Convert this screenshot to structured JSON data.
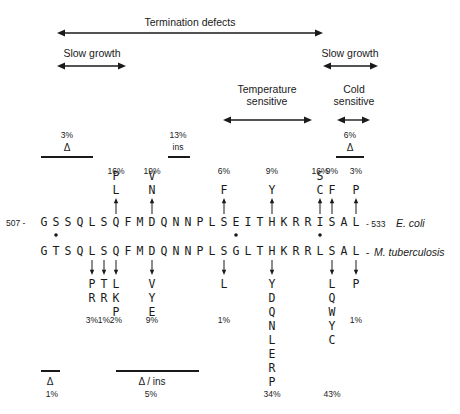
{
  "phenotype_ranges": {
    "termination": {
      "label": "Termination defects",
      "x1": 57,
      "x2": 323,
      "y": 33,
      "label_x": 190,
      "label_y": 16
    },
    "slow_growth_left": {
      "label": "Slow growth",
      "x1": 57,
      "x2": 126,
      "y": 66,
      "label_x": 92,
      "label_y": 47
    },
    "slow_growth_right": {
      "label": "Slow growth",
      "x1": 323,
      "x2": 378,
      "y": 66,
      "label_x": 350,
      "label_y": 47
    },
    "temperature": {
      "label_line1": "Temperature",
      "label_line2": "sensitive",
      "x1": 223,
      "x2": 312,
      "y": 120,
      "label_x": 267,
      "label_y": 83
    },
    "cold": {
      "label_line1": "Cold",
      "label_line2": "sensitive",
      "x1": 337,
      "x2": 370,
      "y": 120,
      "label_x": 354,
      "label_y": 83
    }
  },
  "top_regions": [
    {
      "pct": "3%",
      "type": "Δ",
      "x1": 41,
      "x2": 93,
      "cx": 67
    },
    {
      "pct": "13%",
      "type": "ins",
      "x1": 168,
      "x2": 190,
      "cx": 178
    },
    {
      "pct": "6%",
      "type": "Δ",
      "x1": 336,
      "x2": 364,
      "cx": 350
    }
  ],
  "sequences": {
    "ecoli": {
      "start_label": "507 -",
      "end_label": "- 533",
      "organism": "E. coli",
      "residues": [
        "G",
        "S",
        "S",
        "Q",
        "L",
        "S",
        "Q",
        "F",
        "M",
        "D",
        "Q",
        "N",
        "N",
        "P",
        "L",
        "S",
        "E",
        "I",
        "T",
        "H",
        "K",
        "R",
        "R",
        "I",
        "S",
        "A",
        "L"
      ]
    },
    "mtb": {
      "end_label": "-",
      "organism": "M. tuberculosis",
      "residues": [
        "G",
        "T",
        "S",
        "Q",
        "L",
        "S",
        "Q",
        "F",
        "M",
        "D",
        "Q",
        "N",
        "N",
        "P",
        "L",
        "S",
        "G",
        "L",
        "T",
        "H",
        "K",
        "R",
        "R",
        "L",
        "S",
        "A",
        "L"
      ]
    },
    "difference_markers": [
      1,
      16,
      23
    ],
    "marker_symbol": "*"
  },
  "ecoli_mutations": [
    {
      "index": 6,
      "pct": "16%",
      "variants": [
        "P",
        "L"
      ]
    },
    {
      "index": 9,
      "pct": "19%",
      "variants": [
        "V",
        "N"
      ]
    },
    {
      "index": 15,
      "pct": "6%",
      "variants": [
        "F"
      ]
    },
    {
      "index": 19,
      "pct": "9%",
      "variants": [
        "Y"
      ]
    },
    {
      "index": 23,
      "pct": "16%",
      "variants": [
        "S",
        "C"
      ]
    },
    {
      "index": 24,
      "pct": "9%",
      "variants": [
        "F"
      ]
    },
    {
      "index": 26,
      "pct": "3%",
      "variants": [
        "P"
      ]
    }
  ],
  "mtb_mutations": [
    {
      "index": 4,
      "pct": "3%",
      "variants": [
        "P",
        "R"
      ]
    },
    {
      "index": 5,
      "pct": "1%",
      "variants": [
        "T",
        "R"
      ]
    },
    {
      "index": 6,
      "pct": "2%",
      "variants": [
        "L",
        "K",
        "P"
      ]
    },
    {
      "index": 9,
      "pct": "9%",
      "variants": [
        "V",
        "Y",
        "E"
      ]
    },
    {
      "index": 15,
      "pct": "1%",
      "variants": [
        "L"
      ]
    },
    {
      "index": 19,
      "pct": "34%",
      "variants": [
        "Y",
        "D",
        "Q",
        "N",
        "L",
        "E",
        "R",
        "P"
      ]
    },
    {
      "index": 24,
      "pct": "43%",
      "variants": [
        "L",
        "Q",
        "W",
        "Y",
        "C"
      ]
    },
    {
      "index": 26,
      "pct": "1%",
      "variants": [
        "P"
      ]
    }
  ],
  "bottom_regions": [
    {
      "type": "Δ",
      "pct": "1%",
      "x1": 41,
      "x2": 60,
      "cx": 50
    },
    {
      "type": "Δ / ins",
      "pct": "5%",
      "x1": 116,
      "x2": 199,
      "cx": 151
    }
  ],
  "labels": {
    "ecoli_start": "507 -",
    "ecoli_end": "- 533",
    "ecoli_name": "E. coli",
    "mtb_end": "-",
    "mtb_name": "M. tuberculosis",
    "termination": "Termination defects",
    "slow_left": "Slow growth",
    "slow_right": "Slow growth",
    "temp1": "Temperature",
    "temp2": "sensitive",
    "cold1": "Cold",
    "cold2": "sensitive",
    "r1_pct": "3%",
    "r1_type": "Δ",
    "r2_pct": "13%",
    "r2_type": "ins",
    "r3_pct": "6%",
    "r3_type": "Δ",
    "b1_type": "Δ",
    "b1_pct": "1%",
    "b2_type": "Δ / ins",
    "b2_pct": "5%"
  },
  "colors": {
    "ink": "#1a1a1a",
    "background": "#ffffff"
  }
}
